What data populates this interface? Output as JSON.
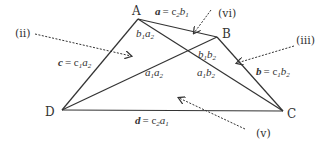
{
  "diagram": {
    "vertices": {
      "A": {
        "label": "A",
        "x": 138,
        "y": 19
      },
      "B": {
        "label": "B",
        "x": 217,
        "y": 37
      },
      "C": {
        "label": "C",
        "x": 283,
        "y": 111
      },
      "D": {
        "label": "D",
        "x": 62,
        "y": 110
      }
    },
    "sides": {
      "a": {
        "name": "a",
        "eq": "= c",
        "sub1": "2",
        "var2": "b",
        "sub2": "1"
      },
      "b": {
        "name": "b",
        "eq": "= c",
        "sub1": "1",
        "var2": "b",
        "sub2": "2"
      },
      "c": {
        "name": "c",
        "eq": "= c",
        "sub1": "1",
        "var2": "a",
        "sub2": "2"
      },
      "d": {
        "name": "d",
        "eq": "= c",
        "sub1": "2",
        "var2": "a",
        "sub2": "1"
      }
    },
    "regions": {
      "b1a2": {
        "v1": "b",
        "s1": "1",
        "v2": "a",
        "s2": "2"
      },
      "b1b2": {
        "v1": "b",
        "s1": "1",
        "v2": "b",
        "s2": "2"
      },
      "a1a2": {
        "v1": "a",
        "s1": "1",
        "v2": "a",
        "s2": "2"
      },
      "a1b2": {
        "v1": "a",
        "s1": "1",
        "v2": "b",
        "s2": "2"
      }
    },
    "pointers": {
      "ii": "(ii)",
      "iii": "(iii)",
      "v": "(v)",
      "vi": "(vi)"
    },
    "colors": {
      "line": "#333333",
      "background": "#ffffff"
    }
  }
}
